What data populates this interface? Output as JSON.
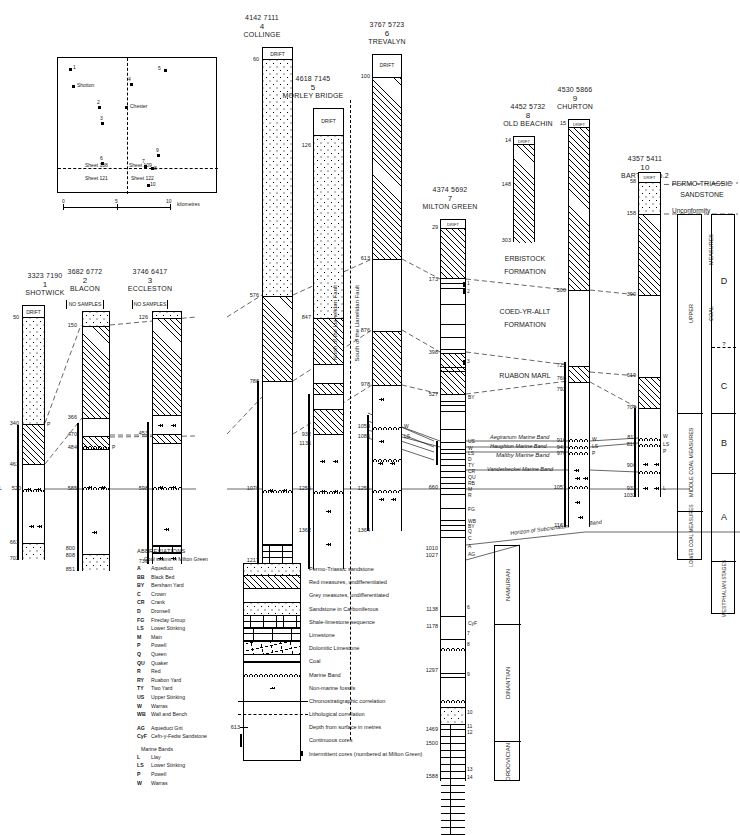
{
  "figure": {
    "depth_unit": "metres"
  },
  "map": {
    "scale_labels": [
      "0",
      "5",
      "10"
    ],
    "scale_unit": "kilometres",
    "sheet_labels": [
      "Sheet 108",
      "Sheet 109",
      "Sheet 121",
      "Sheet 122"
    ],
    "towns": [
      "Shotton",
      "Chester"
    ],
    "points": [
      "1",
      "2",
      "3",
      "4",
      "5",
      "6",
      "7",
      "8",
      "9",
      "10"
    ]
  },
  "boreholes": [
    {
      "id": 1,
      "ngr": "3323 7190",
      "number": "1",
      "name": "SHOTWICK",
      "drift_label": "DRIFT",
      "depths": [
        "50",
        "340",
        "463",
        "520",
        "663",
        "702"
      ],
      "marker": "L",
      "seam_labels": [
        "P"
      ]
    },
    {
      "id": 2,
      "ngr": "3682 6772",
      "number": "2",
      "name": "BLACON",
      "drift_label": "NO SAMPLES",
      "depths": [
        "150",
        "366",
        "470",
        "484",
        "585",
        "800",
        "808",
        "851"
      ],
      "seam_labels": [
        "P"
      ]
    },
    {
      "id": 3,
      "ngr": "3746 6417",
      "number": "3",
      "name": "ECCLESTON",
      "drift_label": "NO SAMPLES",
      "depths": [
        "126",
        "453",
        "598",
        "739"
      ],
      "seam_labels": []
    },
    {
      "id": 4,
      "ngr": "4142 7111",
      "number": "4",
      "name": "COLLINGE",
      "drift_label": "DRIFT",
      "depths": [
        "60",
        "576",
        "788",
        "1079",
        "1217"
      ],
      "seam_labels": []
    },
    {
      "id": 5,
      "ngr": "4618 7145",
      "number": "5",
      "name": "MORLEY BRIDGE",
      "drift_label": "DRIFT",
      "depths": [
        "126",
        "847",
        "932",
        "1136",
        "1255",
        "1362"
      ],
      "seam_labels": []
    },
    {
      "id": 6,
      "ngr": "3767 5723",
      "number": "6",
      "name": "TREVALYN",
      "drift_label": "DRIFT",
      "depths": [
        "100",
        "613",
        "876",
        "978",
        "1053",
        "1086",
        "1251",
        "1364"
      ],
      "seam_labels": [
        "W",
        "LS"
      ]
    },
    {
      "id": 7,
      "ngr": "4374 5692",
      "number": "7",
      "name": "MILTON GREEN",
      "drift_label": "DRIFT",
      "depths": [
        "29",
        "173",
        "398",
        "527",
        "660",
        "1010",
        "1027",
        "1138",
        "1178",
        "1297",
        "1469",
        "1500",
        "1588"
      ],
      "seam_labels": [
        "US",
        "W",
        "LS",
        "D",
        "TY",
        "CR",
        "QU",
        "RB",
        "M",
        "R",
        "FG",
        "WB",
        "BY",
        "S",
        "Q",
        "C",
        "A",
        "AG",
        "CyF"
      ],
      "core_numbers": [
        "1",
        "2",
        "3",
        "4",
        "5",
        "6",
        "7",
        "8",
        "9",
        "10",
        "11",
        "12",
        "13",
        "14"
      ]
    },
    {
      "id": 8,
      "ngr": "4452 5732",
      "number": "8",
      "name": "OLD BEACHIN",
      "drift_label": "DRIFT",
      "depths": [
        "14",
        "148",
        "303"
      ],
      "seam_labels": []
    },
    {
      "id": 9,
      "ngr": "4530 5866",
      "number": "9",
      "name": "CHURTON",
      "drift_label": "DRIFT",
      "depths": [
        "15",
        "500",
        "722",
        "760",
        "792",
        "916",
        "941",
        "970",
        "1057",
        "1161"
      ],
      "seam_labels": [
        "W",
        "LS",
        "P"
      ]
    },
    {
      "id": 10,
      "ngr": "4357 5411",
      "number": "10",
      "name": "BARTON No.2",
      "drift_label": "DRIFT",
      "depths": [
        "58",
        "158",
        "390",
        "619",
        "704",
        "811",
        "819",
        "900",
        "932",
        "1032"
      ],
      "seam_labels": [
        "W",
        "LS",
        "P",
        "L"
      ]
    }
  ],
  "formations": [
    {
      "label": "PERMO-TRIASSIC SANDSTONE"
    },
    {
      "label": "Unconformity"
    },
    {
      "label": "ERBISTOCK FORMATION"
    },
    {
      "label": "COED-YR-ALLT FORMATION"
    },
    {
      "label": "RUABON MARL"
    }
  ],
  "faults": [
    "North of the Llanelidan Fault",
    "South of the Llanelidan Fault"
  ],
  "marine_bands": [
    "Aegiranum Marine Band",
    "Haughton Marine Band",
    "Maltby Marine Band",
    "Vanderbeckei Marine Band",
    "Horizon of  Subcrenatum Marine Band"
  ],
  "classification": {
    "permo_triassic": "PERMO-TRIASSIC SANDSTONE",
    "unconformity": "Unconformity",
    "groups": [
      {
        "measures": "UPPER COAL MEASURES",
        "stage": "D"
      },
      {
        "measures": "",
        "stage": "?"
      },
      {
        "measures": "",
        "stage": "C"
      },
      {
        "measures": "MIDDLE COAL MEASURES",
        "stage": "B"
      },
      {
        "measures": "LOWER COAL MEASURES",
        "stage": "A"
      },
      {
        "measures": "",
        "stage": "WESTPHALIAN STAGES"
      }
    ],
    "upper_text": "UPPER",
    "coal_text": "COAL",
    "measures_text": "MEASURES",
    "middle_text": "MIDDLE COAL MEASURES",
    "lower_text": "LOWER COAL MEASURES",
    "westphalian": "WESTPHALIAN STAGES"
  },
  "systems": [
    "NAMURIAN",
    "DINANTIAN",
    "ORDOVICIAN"
  ],
  "legend": {
    "heading": "ABBREVIATIONS",
    "subheading": "Coal seams in Milton Green",
    "abbreviations": [
      {
        "code": "A",
        "name": "Aqueduct"
      },
      {
        "code": "BB",
        "name": "Black Bed"
      },
      {
        "code": "BY",
        "name": "Bersham Yard"
      },
      {
        "code": "C",
        "name": "Crown"
      },
      {
        "code": "CR",
        "name": "Crank"
      },
      {
        "code": "D",
        "name": "Dronsell"
      },
      {
        "code": "FG",
        "name": "Fireclay Group"
      },
      {
        "code": "LS",
        "name": "Lower Stinking"
      },
      {
        "code": "M",
        "name": "Main"
      },
      {
        "code": "P",
        "name": "Powell"
      },
      {
        "code": "Q",
        "name": "Queen"
      },
      {
        "code": "QU",
        "name": "Quaker"
      },
      {
        "code": "R",
        "name": "Red"
      },
      {
        "code": "RY",
        "name": "Ruabon Yard"
      },
      {
        "code": "TY",
        "name": "Two Yard"
      },
      {
        "code": "US",
        "name": "Upper Stinking"
      },
      {
        "code": "W",
        "name": "Warras"
      },
      {
        "code": "WB",
        "name": "Wall and Bench"
      }
    ],
    "extra_abbreviations": [
      {
        "code": "AG",
        "name": "Aqueduct Grit"
      },
      {
        "code": "CyF",
        "name": "Cefn-y-Fedw Sandstone"
      }
    ],
    "marine_heading": "Marine Bands",
    "marine_abbreviations": [
      {
        "code": "L",
        "name": "Llay"
      },
      {
        "code": "LS",
        "name": "Lower Stinking"
      },
      {
        "code": "P",
        "name": "Powell"
      },
      {
        "code": "W",
        "name": "Warras"
      }
    ],
    "keys": [
      {
        "fill": "f-sand",
        "text": "Permo-Triassic sandstone"
      },
      {
        "fill": "f-red",
        "text": "Red measures, undifferentiated"
      },
      {
        "fill": "f-grey",
        "text": "Grey measures, undifferentiated"
      },
      {
        "fill": "f-sandc",
        "text": "Sandstone in Carboniferous"
      },
      {
        "fill": "f-shale",
        "text": "Shale-limestone sequence"
      },
      {
        "fill": "f-lime",
        "text": "Limestone"
      },
      {
        "fill": "f-dolo",
        "text": "Dolomitic Limestone"
      },
      {
        "fill": "f-coal",
        "text": "Coal"
      },
      {
        "fill": "f-mb",
        "text": "Marine Band"
      },
      {
        "fill": "f-foss",
        "text": "Non-marine fossils"
      },
      {
        "fill": "f-chrono",
        "text": "Chronostratigraphic correlation"
      },
      {
        "fill": "f-litho",
        "text": "Lithological correlation"
      },
      {
        "fill": "f-depth",
        "text": "Depth from surface in metres"
      },
      {
        "fill": "f-core",
        "text": "Continuous cores"
      },
      {
        "fill": "f-icore",
        "text": "Intermittent cores (numbered at Milton Green)"
      }
    ],
    "depth_example": "613"
  }
}
